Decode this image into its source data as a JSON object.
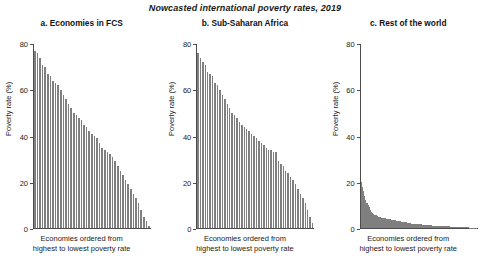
{
  "figure": {
    "title": "Nowcasted international poverty rates, 2019"
  },
  "axes": {
    "y_label": "Poverty rate (%)",
    "x_label_line1": "Economies ordered from",
    "x_label_line2": "highest to lowest poverty rate",
    "y_ticks": [
      "0",
      "20",
      "40",
      "60",
      "80"
    ]
  },
  "colors": {
    "bar": "#7f7f7f",
    "axis": "#4d4d4d",
    "text": "#1a1a1a",
    "background": "#ffffff"
  },
  "panels": [
    {
      "title": "a. Economies in FCS"
    },
    {
      "title": "b. Sub-Saharan Africa"
    },
    {
      "title": "c. Rest of the world"
    }
  ],
  "chart_data": [
    {
      "type": "bar",
      "title": "a. Economies in FCS",
      "xlabel": "Economies ordered from highest to lowest poverty rate",
      "ylabel": "Poverty rate (%)",
      "ylim": [
        0,
        80
      ],
      "yticks": [
        0,
        20,
        40,
        60,
        80
      ],
      "grid": false,
      "legend": "none",
      "categories": [
        "1",
        "2",
        "3",
        "4",
        "5",
        "6",
        "7",
        "8",
        "9",
        "10",
        "11",
        "12",
        "13",
        "14",
        "15",
        "16",
        "17",
        "18",
        "19",
        "20",
        "21",
        "22",
        "23",
        "24",
        "25",
        "26",
        "27",
        "28",
        "29",
        "30",
        "31",
        "32",
        "33",
        "34",
        "35",
        "36",
        "37",
        "38",
        "39",
        "40",
        "41",
        "42",
        "43",
        "44",
        "45"
      ],
      "values": [
        77,
        76,
        74,
        71,
        70,
        67,
        66,
        64,
        63,
        62,
        60,
        58,
        56,
        54,
        52,
        50,
        49,
        48,
        47,
        45,
        44,
        42,
        41,
        40,
        39,
        37,
        35,
        34,
        33,
        32,
        31,
        29,
        27,
        25,
        23,
        21,
        19,
        17,
        15,
        13,
        11,
        8,
        5,
        3,
        1
      ]
    },
    {
      "type": "bar",
      "title": "b. Sub-Saharan Africa",
      "xlabel": "Economies ordered from highest to lowest poverty rate",
      "ylabel": "Poverty rate (%)",
      "ylim": [
        0,
        80
      ],
      "yticks": [
        0,
        20,
        40,
        60,
        80
      ],
      "grid": false,
      "legend": "none",
      "categories": [
        "1",
        "2",
        "3",
        "4",
        "5",
        "6",
        "7",
        "8",
        "9",
        "10",
        "11",
        "12",
        "13",
        "14",
        "15",
        "16",
        "17",
        "18",
        "19",
        "20",
        "21",
        "22",
        "23",
        "24",
        "25",
        "26",
        "27",
        "28",
        "29",
        "30",
        "31",
        "32",
        "33",
        "34",
        "35",
        "36",
        "37",
        "38",
        "39",
        "40",
        "41",
        "42",
        "43",
        "44",
        "45",
        "46",
        "47",
        "48"
      ],
      "values": [
        76,
        74,
        72,
        71,
        68,
        67,
        66,
        63,
        62,
        60,
        58,
        56,
        54,
        52,
        50,
        49,
        48,
        46,
        45,
        44,
        43,
        42,
        41,
        40,
        39,
        38,
        37,
        36,
        35,
        34,
        34,
        33,
        33,
        29,
        28,
        27,
        25,
        24,
        22,
        21,
        19,
        17,
        15,
        13,
        11,
        8,
        5,
        2
      ]
    },
    {
      "type": "bar",
      "title": "c. Rest of the world",
      "xlabel": "Economies ordered from highest to lowest poverty rate",
      "ylabel": "Poverty rate (%)",
      "ylim": [
        0,
        80
      ],
      "yticks": [
        0,
        20,
        40,
        60,
        80
      ],
      "grid": false,
      "legend": "none",
      "categories": [
        "1",
        "2",
        "3",
        "4",
        "5",
        "6",
        "7",
        "8",
        "9",
        "10",
        "11",
        "12",
        "13",
        "14",
        "15",
        "16",
        "17",
        "18",
        "19",
        "20",
        "21",
        "22",
        "23",
        "24",
        "25",
        "26",
        "27",
        "28",
        "29",
        "30",
        "31",
        "32",
        "33",
        "34",
        "35",
        "36",
        "37",
        "38",
        "39",
        "40",
        "41",
        "42",
        "43",
        "44",
        "45",
        "46",
        "47",
        "48",
        "49",
        "50",
        "51",
        "52",
        "53",
        "54",
        "55",
        "56",
        "57",
        "58",
        "59",
        "60",
        "61",
        "62",
        "63",
        "64",
        "65",
        "66",
        "67",
        "68",
        "69",
        "70",
        "71",
        "72",
        "73",
        "74",
        "75",
        "76",
        "77",
        "78",
        "79",
        "80",
        "81",
        "82",
        "83",
        "84",
        "85",
        "86",
        "87",
        "88",
        "89",
        "90",
        "91",
        "92",
        "93",
        "94",
        "95",
        "96",
        "97",
        "98",
        "99",
        "100"
      ],
      "values": [
        20,
        18,
        16,
        14,
        12,
        11,
        10,
        9,
        8,
        7,
        6.5,
        6,
        5.8,
        5.5,
        5.2,
        5,
        4.8,
        4.6,
        4.5,
        4.4,
        4.3,
        4.2,
        4.1,
        4,
        3.9,
        3.8,
        3.7,
        3.6,
        3.5,
        3.4,
        3.3,
        3.2,
        3.1,
        3,
        2.9,
        2.8,
        2.7,
        2.6,
        2.5,
        2.4,
        2.3,
        2.2,
        2.1,
        2,
        1.95,
        1.9,
        1.85,
        1.8,
        1.75,
        1.7,
        1.65,
        1.6,
        1.55,
        1.5,
        1.45,
        1.4,
        1.35,
        1.3,
        1.25,
        1.2,
        1.15,
        1.1,
        1.05,
        1,
        0.98,
        0.95,
        0.92,
        0.9,
        0.88,
        0.85,
        0.82,
        0.8,
        0.78,
        0.75,
        0.72,
        0.7,
        0.68,
        0.65,
        0.62,
        0.6,
        0.58,
        0.55,
        0.52,
        0.5,
        0.48,
        0.45,
        0.42,
        0.4,
        0.38,
        0.35,
        0.32,
        0.3,
        0.28,
        0.25,
        0.22,
        0.2,
        0.17,
        0.14,
        0.11,
        0.08,
        0.05
      ]
    }
  ]
}
